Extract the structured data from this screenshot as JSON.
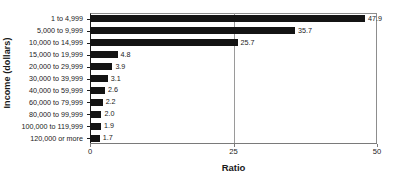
{
  "chart_data": {
    "type": "bar",
    "orientation": "horizontal",
    "title": "",
    "xlabel": "Ratio",
    "ylabel": "Income (dollars)",
    "categories": [
      "1 to 4,999",
      "5,000 to 9,999",
      "10,000 to 14,999",
      "15,000 to 19,999",
      "20,000 to 29,999",
      "30,000 to 39,999",
      "40,000 to 59,999",
      "60,000 to 79,999",
      "80,000 to 99,999",
      "100,000 to 119,999",
      "120,000 or more"
    ],
    "values": [
      47.9,
      35.7,
      25.7,
      4.8,
      3.9,
      3.1,
      2.6,
      2.2,
      2.0,
      1.9,
      1.7
    ],
    "value_labels": [
      "47.9",
      "35.7",
      "25.7",
      "4.8",
      "3.9",
      "3.1",
      "2.6",
      "2.2",
      "2.0",
      "1.9",
      "1.7"
    ],
    "xlim": [
      0,
      50
    ],
    "xticks": [
      0,
      25,
      50
    ],
    "xtick_labels": [
      "0",
      "25",
      "50"
    ],
    "gridlines": [
      25
    ],
    "grid": true,
    "legend": null,
    "bar_color": "#141414",
    "axis_color": "#1a1a1a",
    "grid_color": "#9a9a9a"
  }
}
